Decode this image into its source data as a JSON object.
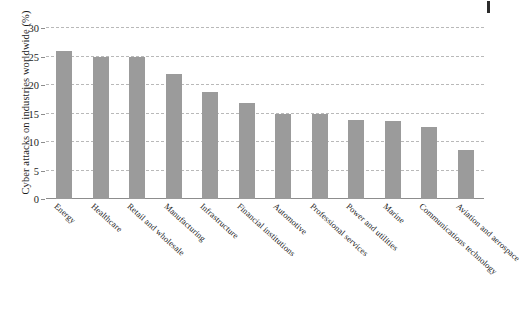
{
  "chart_data": {
    "type": "bar",
    "title": "",
    "xlabel": "",
    "ylabel": "Cyber attacks on industries worldwide (%)",
    "ylim": [
      0,
      30
    ],
    "yticks": [
      0,
      5,
      10,
      15,
      20,
      25,
      30
    ],
    "grid": true,
    "legend": null,
    "bar_color": "#9b9b9b",
    "categories": [
      "Energy",
      "Healthcare",
      "Retail and wholesale",
      "Manufacturing",
      "Infrastructure",
      "Financial institutions",
      "Automotive",
      "Professional services",
      "Power and utilities",
      "Marine",
      "Communications technology",
      "Aviation and aerospace"
    ],
    "values": [
      26.0,
      24.9,
      24.9,
      21.9,
      18.8,
      16.8,
      14.9,
      14.9,
      13.8,
      13.7,
      12.6,
      8.6
    ]
  }
}
